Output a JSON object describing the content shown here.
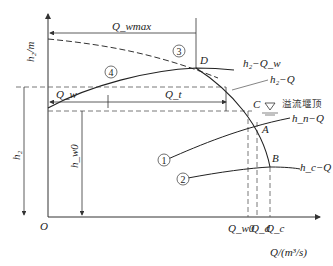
{
  "diagram": {
    "axes": {
      "y_label": "h₂/m",
      "x_label": "Q/(m³/s)",
      "origin": "O"
    },
    "curves": [
      {
        "id": "1",
        "label": "h_n−Q",
        "style": "solid"
      },
      {
        "id": "2",
        "label": "h_c−Q",
        "style": "solid"
      },
      {
        "id": "3",
        "label": "",
        "style": "dashed"
      },
      {
        "id": "4",
        "label": "h₂−Q_w",
        "style": "solid"
      },
      {
        "id": "h2Q",
        "label": "h₂−Q",
        "style": "solid"
      }
    ],
    "points": [
      "D",
      "C",
      "A",
      "B"
    ],
    "dimensions": {
      "q_wmax": "Q_wmax",
      "q_w": "Q_w",
      "q_t": "Q_t",
      "h2": "h₂",
      "hw0": "h_w0"
    },
    "x_ticks": [
      "Q_w0",
      "Q_d",
      "Q_c"
    ],
    "annotation": "溢流堰顶"
  }
}
